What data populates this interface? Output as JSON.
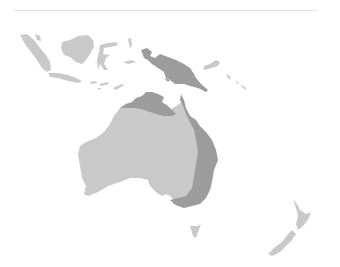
{
  "map": {
    "region": "Oceania",
    "colors": {
      "background": "#ffffff",
      "rule": "#e2e2e2",
      "light": "#c9c9c9",
      "dark": "#9c9c9c"
    },
    "regions": [
      {
        "name": "Sumatra",
        "shade": "light"
      },
      {
        "name": "Borneo",
        "shade": "light"
      },
      {
        "name": "Sulawesi",
        "shade": "light"
      },
      {
        "name": "Java",
        "shade": "light"
      },
      {
        "name": "Lesser Sunda Islands",
        "shade": "light"
      },
      {
        "name": "Maluku",
        "shade": "light"
      },
      {
        "name": "New Guinea",
        "shade": "dark"
      },
      {
        "name": "New Britain",
        "shade": "light"
      },
      {
        "name": "Solomon Islands",
        "shade": "light"
      },
      {
        "name": "Australia (west/central)",
        "shade": "light"
      },
      {
        "name": "Top End (Northern Territory)",
        "shade": "dark"
      },
      {
        "name": "Eastern Australia (Queensland/NSW/Victoria)",
        "shade": "dark"
      },
      {
        "name": "Tasmania",
        "shade": "light"
      },
      {
        "name": "New Zealand North Island",
        "shade": "light"
      },
      {
        "name": "New Zealand South Island",
        "shade": "light"
      }
    ]
  }
}
